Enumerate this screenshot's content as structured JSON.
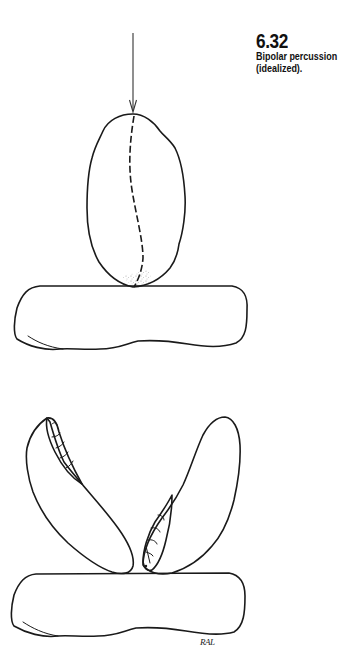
{
  "figure": {
    "number": "6.32",
    "title_line1": "Bipolar percussion",
    "title_line2": "(idealized).",
    "signature": "RAL"
  },
  "illustration": {
    "top_panel": {
      "elements": [
        "force-arrow",
        "core-stone",
        "fracture-line-dashed",
        "anvil-stone"
      ]
    },
    "bottom_panel": {
      "elements": [
        "split-fragment-left",
        "split-fragment-right",
        "flake-scar-left",
        "flake-scar-right",
        "anvil-stone"
      ]
    },
    "colors": {
      "ink": "#1a1a1a",
      "stipple": "#555555",
      "background": "#ffffff"
    }
  }
}
